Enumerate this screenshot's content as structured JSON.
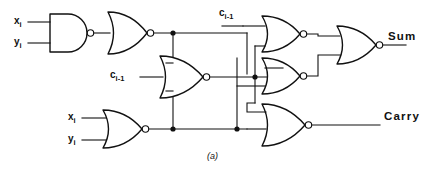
{
  "figure": {
    "caption": "(a)"
  },
  "inputs": [
    {
      "id": "x-top",
      "base": "x",
      "sub": "i",
      "label": "x_i"
    },
    {
      "id": "y-top",
      "base": "y",
      "sub": "i",
      "label": "y_i"
    },
    {
      "id": "carry-mid",
      "base": "c",
      "sub": "i-1",
      "label": "c_i-1"
    },
    {
      "id": "carry-top",
      "base": "c",
      "sub": "i-1",
      "label": "c_i-1"
    },
    {
      "id": "x-bottom",
      "base": "x",
      "sub": "i",
      "label": "x_i"
    },
    {
      "id": "y-bottom",
      "base": "y",
      "sub": "i",
      "label": "y_i"
    }
  ],
  "outputs": [
    {
      "id": "sum",
      "label": "Sum"
    },
    {
      "id": "carry",
      "label": "Carry"
    }
  ],
  "gates": [
    {
      "id": "g1",
      "type": "NAND",
      "inputs": 2,
      "label": "nand-gate-xy"
    },
    {
      "id": "g2",
      "type": "NOR",
      "inputs": 1,
      "label": "nor-gate-inverter-top"
    },
    {
      "id": "g3",
      "type": "NOR",
      "inputs": 3,
      "label": "nor-gate-middle"
    },
    {
      "id": "g4",
      "type": "NOR",
      "inputs": 2,
      "label": "nor-gate-xy-bottom"
    },
    {
      "id": "g5",
      "type": "NOR",
      "inputs": 3,
      "label": "nor-gate-sum-upper"
    },
    {
      "id": "g6",
      "type": "NOR",
      "inputs": 3,
      "label": "nor-gate-sum-lower"
    },
    {
      "id": "g7",
      "type": "NOR",
      "inputs": 3,
      "label": "nor-gate-carry"
    },
    {
      "id": "g8",
      "type": "NOR",
      "inputs": 2,
      "label": "nor-gate-sum-output"
    }
  ],
  "colors": {
    "ink": "#111111",
    "background": "#ffffff"
  }
}
